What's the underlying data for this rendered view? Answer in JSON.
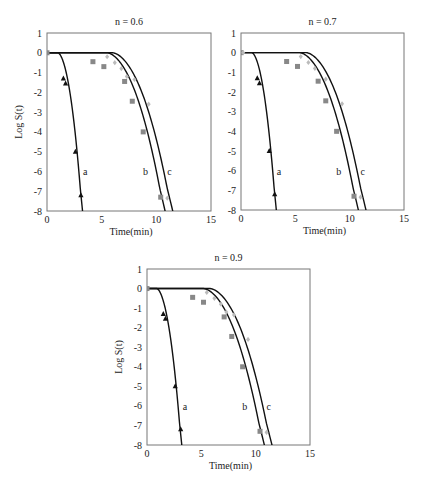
{
  "chart_data": [
    {
      "type": "scatter",
      "title": "n = 0.6",
      "xlabel": "Time(min)",
      "ylabel": "Log S(t)",
      "xlim": [
        0,
        15
      ],
      "ylim": [
        -8,
        1
      ],
      "xticks": [
        0,
        5,
        10,
        15
      ],
      "yticks": [
        1,
        0,
        -1,
        -2,
        -3,
        -4,
        -5,
        -6,
        -7,
        -8
      ],
      "grid": false,
      "series": [
        {
          "name": "a",
          "marker": "triangle",
          "color": "#111111",
          "points": [
            [
              1.5,
              -1.3
            ],
            [
              1.7,
              -1.55
            ],
            [
              2.6,
              -5.0
            ],
            [
              3.1,
              -7.2
            ]
          ],
          "fit": {
            "lag": 1.0,
            "end": 3.25
          }
        },
        {
          "name": "b",
          "marker": "square",
          "color": "#888888",
          "points": [
            [
              0,
              0
            ],
            [
              4.2,
              -0.45
            ],
            [
              5.2,
              -0.7
            ],
            [
              7.1,
              -1.45
            ],
            [
              7.8,
              -2.45
            ],
            [
              8.8,
              -4.0
            ],
            [
              10.4,
              -7.3
            ]
          ],
          "fit": {
            "lag": 5.5,
            "end": 10.8
          }
        },
        {
          "name": "c",
          "marker": "diamond",
          "color": "#bbbbbb",
          "points": [
            [
              5.5,
              -0.2
            ],
            [
              6.2,
              -0.5
            ],
            [
              6.8,
              -0.8
            ],
            [
              7.3,
              -1.2
            ],
            [
              8.0,
              -1.35
            ],
            [
              9.3,
              -2.6
            ],
            [
              11.0,
              -7.35
            ]
          ],
          "fit": {
            "lag": 6.0,
            "end": 11.5
          }
        }
      ],
      "curve_labels": [
        {
          "text": "a",
          "x": 3.5,
          "y": -6.0
        },
        {
          "text": "b",
          "x": 9.0,
          "y": -6.0
        },
        {
          "text": "c",
          "x": 11.2,
          "y": -6.0
        }
      ]
    },
    {
      "type": "scatter",
      "title": "n = 0.7",
      "xlabel": "Time(min)",
      "ylabel": "",
      "xlim": [
        0,
        15
      ],
      "ylim": [
        -8,
        1
      ],
      "xticks": [
        0,
        5,
        10,
        15
      ],
      "yticks": [
        1,
        0,
        -1,
        -2,
        -3,
        -4,
        -5,
        -6,
        -7,
        -8
      ],
      "grid": false,
      "series": [
        {
          "name": "a",
          "marker": "triangle",
          "color": "#111111",
          "points": [
            [
              1.5,
              -1.3
            ],
            [
              1.7,
              -1.55
            ],
            [
              2.6,
              -5.0
            ],
            [
              3.1,
              -7.2
            ]
          ],
          "fit": {
            "lag": 1.0,
            "end": 3.25
          }
        },
        {
          "name": "b",
          "marker": "square",
          "color": "#888888",
          "points": [
            [
              0,
              0
            ],
            [
              4.2,
              -0.45
            ],
            [
              5.2,
              -0.7
            ],
            [
              7.1,
              -1.45
            ],
            [
              7.8,
              -2.45
            ],
            [
              8.8,
              -4.0
            ],
            [
              10.4,
              -7.3
            ]
          ],
          "fit": {
            "lag": 5.4,
            "end": 10.8
          }
        },
        {
          "name": "c",
          "marker": "diamond",
          "color": "#bbbbbb",
          "points": [
            [
              0.2,
              0
            ],
            [
              5.5,
              -0.2
            ],
            [
              6.2,
              -0.5
            ],
            [
              6.8,
              -0.8
            ],
            [
              7.8,
              -1.35
            ],
            [
              9.3,
              -2.6
            ],
            [
              11.0,
              -7.35
            ]
          ],
          "fit": {
            "lag": 6.0,
            "end": 11.5
          }
        }
      ],
      "curve_labels": [
        {
          "text": "a",
          "x": 3.5,
          "y": -6.0
        },
        {
          "text": "b",
          "x": 9.0,
          "y": -6.0
        },
        {
          "text": "c",
          "x": 11.2,
          "y": -6.0
        }
      ]
    },
    {
      "type": "scatter",
      "title": "n = 0.9",
      "xlabel": "Time(min)",
      "ylabel": "Log S(t)",
      "xlim": [
        0,
        15
      ],
      "ylim": [
        -8,
        1
      ],
      "xticks": [
        0,
        5,
        10,
        15
      ],
      "yticks": [
        1,
        0,
        -1,
        -2,
        -3,
        -4,
        -5,
        -6,
        -7,
        -8
      ],
      "grid": false,
      "series": [
        {
          "name": "a",
          "marker": "triangle",
          "color": "#111111",
          "points": [
            [
              1.5,
              -1.3
            ],
            [
              1.7,
              -1.55
            ],
            [
              2.6,
              -5.0
            ],
            [
              3.1,
              -7.2
            ]
          ],
          "fit": {
            "lag": 0.9,
            "end": 3.2
          }
        },
        {
          "name": "b",
          "marker": "square",
          "color": "#888888",
          "points": [
            [
              0,
              0
            ],
            [
              4.2,
              -0.45
            ],
            [
              5.2,
              -0.7
            ],
            [
              7.1,
              -1.45
            ],
            [
              7.8,
              -2.45
            ],
            [
              8.8,
              -4.0
            ],
            [
              10.4,
              -7.3
            ]
          ],
          "fit": {
            "lag": 5.2,
            "end": 10.8
          }
        },
        {
          "name": "c",
          "marker": "diamond",
          "color": "#bbbbbb",
          "points": [
            [
              5.5,
              -0.2
            ],
            [
              6.2,
              -0.5
            ],
            [
              6.8,
              -0.8
            ],
            [
              7.3,
              -1.2
            ],
            [
              8.0,
              -1.35
            ],
            [
              9.3,
              -2.6
            ],
            [
              11.0,
              -7.35
            ]
          ],
          "fit": {
            "lag": 5.8,
            "end": 11.5
          }
        }
      ],
      "curve_labels": [
        {
          "text": "a",
          "x": 3.5,
          "y": -6.0
        },
        {
          "text": "b",
          "x": 9.0,
          "y": -6.0
        },
        {
          "text": "c",
          "x": 11.2,
          "y": -6.0
        }
      ]
    }
  ],
  "layout": {
    "panels": [
      {
        "left": 47,
        "top": 33,
        "right": 211,
        "bottom": 211
      },
      {
        "left": 241,
        "top": 33,
        "right": 404,
        "bottom": 210
      },
      {
        "left": 147,
        "top": 269,
        "right": 310,
        "bottom": 445
      }
    ]
  }
}
